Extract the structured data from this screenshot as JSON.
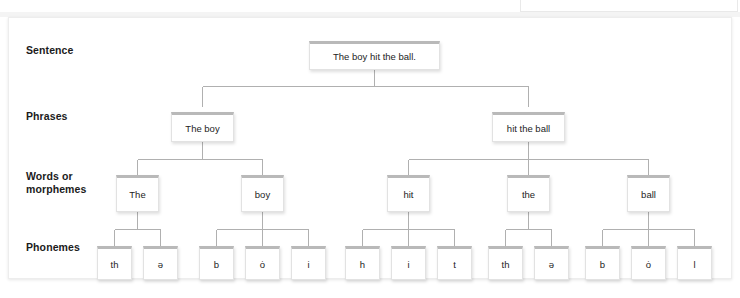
{
  "diagram": {
    "accent_color": "#b9b9b9",
    "card_background": "#ffffff",
    "page_background": "#ffffff",
    "text_color": "#242424",
    "label_color": "#1b1b1b",
    "line_color": "#b0b0b0",
    "rows": [
      {
        "key": "sentence",
        "label": "Sentence"
      },
      {
        "key": "phrases",
        "label": "Phrases"
      },
      {
        "key": "words",
        "label": "Words or\nmorphemes"
      },
      {
        "key": "phonemes",
        "label": "Phonemes"
      }
    ],
    "sentence": {
      "text": "The boy hit the ball."
    },
    "phrases": [
      {
        "text": "The boy"
      },
      {
        "text": "hit the ball"
      }
    ],
    "words": [
      {
        "text": "The"
      },
      {
        "text": "boy"
      },
      {
        "text": "hit"
      },
      {
        "text": "the"
      },
      {
        "text": "ball"
      }
    ],
    "phonemes": [
      {
        "text": "th"
      },
      {
        "text": "ə"
      },
      {
        "text": "b"
      },
      {
        "text": "ȯ"
      },
      {
        "text": "i"
      },
      {
        "text": "h"
      },
      {
        "text": "i"
      },
      {
        "text": "t"
      },
      {
        "text": "th"
      },
      {
        "text": "ə"
      },
      {
        "text": "b"
      },
      {
        "text": "ȯ"
      },
      {
        "text": "l"
      }
    ]
  }
}
